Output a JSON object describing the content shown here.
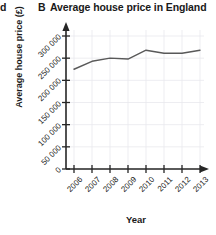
{
  "header": {
    "cutoff_letter": "d",
    "panel_letter": "B",
    "title": "Average house price in England"
  },
  "axes": {
    "ylabel": "Average house price (£)",
    "xlabel": "Year"
  },
  "chart_data": {
    "type": "line",
    "title": "Average house price in England",
    "xlabel": "Year",
    "ylabel": "Average house price (£)",
    "categories": [
      "2006",
      "2007",
      "2008",
      "2009",
      "2010",
      "2011",
      "2012",
      "2013"
    ],
    "x": [
      2006,
      2007,
      2008,
      2009,
      2010,
      2011,
      2012,
      2013
    ],
    "values": [
      225000,
      243000,
      250000,
      248000,
      268000,
      261000,
      261000,
      268000
    ],
    "series": [
      {
        "name": "Average house price",
        "values": [
          225000,
          243000,
          250000,
          248000,
          268000,
          261000,
          261000,
          268000
        ]
      }
    ],
    "ylim": [
      0,
      300000
    ],
    "yticks": [
      0,
      50000,
      100000,
      150000,
      200000,
      250000,
      300000
    ],
    "ytick_labels": [
      "0",
      "50 000",
      "100 000",
      "150 000",
      "200 000",
      "250 000",
      "300 000"
    ],
    "xtick_labels": [
      "2006",
      "2007",
      "2008",
      "2009",
      "2010",
      "2011",
      "2012",
      "2013"
    ],
    "grid": true,
    "legend": false,
    "line_color": "#595959",
    "grid_color": "#e8e8ee",
    "axis_color": "#262626"
  }
}
